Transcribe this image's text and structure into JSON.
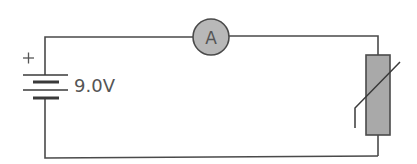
{
  "diagram": {
    "type": "circuit",
    "components": {
      "battery": {
        "label": "9.0V",
        "polarity_marker": "+"
      },
      "ammeter": {
        "label": "A",
        "fill": "#b8b8b8"
      },
      "thermistor": {
        "fill": "#a9a9a9"
      }
    },
    "colors": {
      "wire": "#4a4a4a",
      "text": "#555555",
      "component_fill": "#b0b0b0"
    }
  }
}
